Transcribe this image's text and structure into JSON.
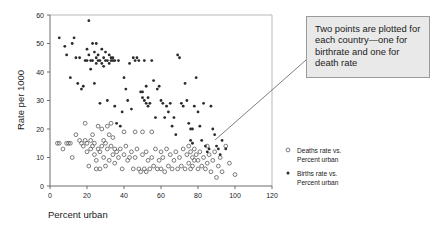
{
  "axes": {
    "ylabel": "Rate per 1000",
    "xlabel": "Percent urban",
    "yticks": [
      "0",
      "10",
      "20",
      "30",
      "40",
      "50",
      "60"
    ],
    "xticks": [
      "0",
      "20",
      "40",
      "60",
      "80",
      "100",
      "120"
    ]
  },
  "legend": {
    "items": [
      {
        "marker": "open-circle",
        "line1": "Deaths rate vs.",
        "line2": "Percent urban"
      },
      {
        "marker": "filled-dot",
        "line1": "Births rate vs.",
        "line2": "Percent urban"
      }
    ]
  },
  "callout": {
    "text": "Two points are plotted for each country—one for birthrate and one for death rate"
  },
  "colors": {
    "callout_bg": "#e9e9e9",
    "callout_border": "#9a9a9a",
    "births_marker": "#2b2b2b",
    "deaths_marker": "#5a5a5a",
    "axis": "#6d6d6d"
  },
  "chart_data": {
    "type": "scatter",
    "title": "",
    "xlabel": "Percent urban",
    "ylabel": "Rate per 1000",
    "xlim": [
      0,
      120
    ],
    "ylim": [
      0,
      60
    ],
    "xticks": [
      0,
      20,
      40,
      60,
      80,
      100,
      120
    ],
    "yticks": [
      0,
      10,
      20,
      30,
      40,
      50,
      60
    ],
    "grid": false,
    "legend_position": "right",
    "series": [
      {
        "name": "Births rate vs. Percent urban",
        "marker": "filled-dot",
        "color": "#2b2b2b",
        "points": [
          [
            5,
            52
          ],
          [
            8,
            49
          ],
          [
            9,
            46
          ],
          [
            11,
            38
          ],
          [
            12,
            50
          ],
          [
            13,
            52
          ],
          [
            14,
            45
          ],
          [
            15,
            36
          ],
          [
            16,
            45
          ],
          [
            17,
            34
          ],
          [
            18,
            35
          ],
          [
            19,
            44
          ],
          [
            20,
            48
          ],
          [
            20,
            44
          ],
          [
            21,
            46
          ],
          [
            21,
            58
          ],
          [
            22,
            44
          ],
          [
            22,
            41
          ],
          [
            23,
            50
          ],
          [
            23,
            44
          ],
          [
            24,
            47
          ],
          [
            24,
            36
          ],
          [
            25,
            50
          ],
          [
            25,
            45
          ],
          [
            25,
            43
          ],
          [
            26,
            44
          ],
          [
            26,
            46
          ],
          [
            27,
            29
          ],
          [
            27,
            44
          ],
          [
            28,
            48
          ],
          [
            28,
            43
          ],
          [
            29,
            45
          ],
          [
            29,
            42
          ],
          [
            30,
            47
          ],
          [
            30,
            44
          ],
          [
            31,
            44
          ],
          [
            31,
            30
          ],
          [
            32,
            46
          ],
          [
            32,
            43
          ],
          [
            33,
            45
          ],
          [
            33,
            44
          ],
          [
            34,
            44
          ],
          [
            34,
            45
          ],
          [
            35,
            44
          ],
          [
            35,
            28
          ],
          [
            36,
            22
          ],
          [
            37,
            44
          ],
          [
            38,
            21
          ],
          [
            39,
            26
          ],
          [
            40,
            38
          ],
          [
            41,
            34
          ],
          [
            42,
            30
          ],
          [
            43,
            43
          ],
          [
            44,
            27
          ],
          [
            45,
            45
          ],
          [
            46,
            44
          ],
          [
            47,
            45
          ],
          [
            48,
            44
          ],
          [
            49,
            33
          ],
          [
            50,
            33
          ],
          [
            50,
            31
          ],
          [
            51,
            30
          ],
          [
            51,
            44
          ],
          [
            52,
            29
          ],
          [
            52,
            35
          ],
          [
            53,
            28
          ],
          [
            53,
            31
          ],
          [
            54,
            29
          ],
          [
            55,
            44
          ],
          [
            56,
            37
          ],
          [
            57,
            24
          ],
          [
            58,
            34
          ],
          [
            59,
            35
          ],
          [
            60,
            30
          ],
          [
            61,
            29
          ],
          [
            62,
            24
          ],
          [
            63,
            28
          ],
          [
            64,
            26
          ],
          [
            65,
            29
          ],
          [
            66,
            21
          ],
          [
            67,
            24
          ],
          [
            68,
            18
          ],
          [
            69,
            46
          ],
          [
            70,
            45
          ],
          [
            71,
            29
          ],
          [
            72,
            28
          ],
          [
            73,
            36
          ],
          [
            74,
            30
          ],
          [
            75,
            22
          ],
          [
            76,
            20
          ],
          [
            76,
            16
          ],
          [
            77,
            20
          ],
          [
            77,
            15
          ],
          [
            78,
            28
          ],
          [
            79,
            38
          ],
          [
            80,
            26
          ],
          [
            81,
            21
          ],
          [
            82,
            16
          ],
          [
            83,
            29
          ],
          [
            84,
            14
          ],
          [
            85,
            12
          ],
          [
            86,
            13
          ],
          [
            87,
            28
          ],
          [
            88,
            20
          ],
          [
            89,
            18
          ],
          [
            90,
            14
          ],
          [
            91,
            13
          ],
          [
            92,
            11
          ],
          [
            93,
            16
          ],
          [
            95,
            13
          ]
        ]
      },
      {
        "name": "Deaths rate vs. Percent urban",
        "marker": "open-circle",
        "color": "#5a5a5a",
        "points": [
          [
            4,
            15
          ],
          [
            5,
            15
          ],
          [
            7,
            13
          ],
          [
            9,
            15
          ],
          [
            10,
            15
          ],
          [
            11,
            15
          ],
          [
            12,
            10
          ],
          [
            14,
            18
          ],
          [
            16,
            16
          ],
          [
            17,
            15
          ],
          [
            18,
            14
          ],
          [
            19,
            22
          ],
          [
            19,
            16
          ],
          [
            20,
            15
          ],
          [
            20,
            12
          ],
          [
            21,
            7
          ],
          [
            22,
            16
          ],
          [
            22,
            13
          ],
          [
            23,
            18
          ],
          [
            23,
            14
          ],
          [
            24,
            15
          ],
          [
            24,
            11
          ],
          [
            25,
            9
          ],
          [
            25,
            6
          ],
          [
            26,
            21
          ],
          [
            26,
            13
          ],
          [
            27,
            12
          ],
          [
            27,
            6
          ],
          [
            28,
            20
          ],
          [
            28,
            14
          ],
          [
            29,
            16
          ],
          [
            29,
            10
          ],
          [
            30,
            15
          ],
          [
            30,
            7
          ],
          [
            31,
            21
          ],
          [
            31,
            13
          ],
          [
            32,
            18
          ],
          [
            32,
            9
          ],
          [
            33,
            22
          ],
          [
            33,
            14
          ],
          [
            34,
            17
          ],
          [
            34,
            11
          ],
          [
            35,
            13
          ],
          [
            35,
            8
          ],
          [
            36,
            12
          ],
          [
            37,
            10
          ],
          [
            38,
            13
          ],
          [
            39,
            6
          ],
          [
            40,
            19
          ],
          [
            40,
            11
          ],
          [
            41,
            14
          ],
          [
            42,
            9
          ],
          [
            43,
            10
          ],
          [
            44,
            12
          ],
          [
            45,
            6
          ],
          [
            46,
            19
          ],
          [
            46,
            10
          ],
          [
            47,
            13
          ],
          [
            48,
            6
          ],
          [
            49,
            5
          ],
          [
            50,
            19
          ],
          [
            50,
            11
          ],
          [
            51,
            6
          ],
          [
            52,
            12
          ],
          [
            52,
            5
          ],
          [
            53,
            9
          ],
          [
            54,
            6
          ],
          [
            55,
            19
          ],
          [
            55,
            10
          ],
          [
            56,
            7
          ],
          [
            57,
            13
          ],
          [
            58,
            6
          ],
          [
            59,
            9
          ],
          [
            60,
            12
          ],
          [
            60,
            6
          ],
          [
            61,
            10
          ],
          [
            62,
            5
          ],
          [
            63,
            13
          ],
          [
            64,
            7
          ],
          [
            65,
            11
          ],
          [
            66,
            6
          ],
          [
            67,
            9
          ],
          [
            68,
            12
          ],
          [
            69,
            6
          ],
          [
            70,
            10
          ],
          [
            71,
            7
          ],
          [
            72,
            13
          ],
          [
            73,
            6
          ],
          [
            74,
            11
          ],
          [
            75,
            8
          ],
          [
            75,
            14
          ],
          [
            76,
            12
          ],
          [
            76,
            6
          ],
          [
            77,
            10
          ],
          [
            77,
            7
          ],
          [
            78,
            13
          ],
          [
            78,
            9
          ],
          [
            79,
            11
          ],
          [
            80,
            6
          ],
          [
            80,
            9
          ],
          [
            81,
            12
          ],
          [
            82,
            7
          ],
          [
            83,
            10
          ],
          [
            84,
            6
          ],
          [
            85,
            14
          ],
          [
            85,
            8
          ],
          [
            86,
            11
          ],
          [
            87,
            5
          ],
          [
            88,
            9
          ],
          [
            89,
            12
          ],
          [
            90,
            3
          ],
          [
            91,
            7
          ],
          [
            92,
            10
          ],
          [
            93,
            5
          ],
          [
            95,
            14
          ],
          [
            97,
            8
          ],
          [
            100,
            4
          ]
        ]
      }
    ]
  }
}
